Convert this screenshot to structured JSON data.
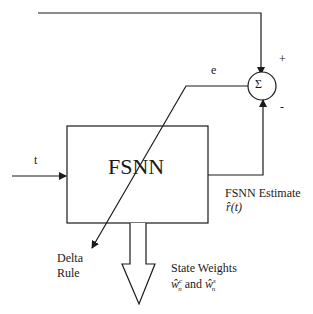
{
  "diagram": {
    "type": "block-diagram",
    "blocks": [
      {
        "id": "fsnn",
        "label": "FSNN"
      },
      {
        "id": "sum",
        "label": "Σ"
      }
    ],
    "summer_signs": {
      "plus": "+",
      "minus": "-"
    },
    "labels": {
      "input": "t",
      "error": "e",
      "estimate_title": "FSNN Estimate",
      "estimate_symbol": "r̂(t)",
      "delta_rule_line1": "Delta",
      "delta_rule_line2": "Rule",
      "weights_title": "State Weights",
      "weights_c": "ŵ",
      "weights_c_sup": "c",
      "weights_c_sub": "n",
      "weights_and": " and ",
      "weights_s": "ŵ",
      "weights_s_sup": "s",
      "weights_s_sub": "n"
    },
    "connections": [
      {
        "from": "reference",
        "to": "sum",
        "sign": "+"
      },
      {
        "from": "fsnn",
        "to": "sum",
        "sign": "-"
      },
      {
        "from": "input_t",
        "to": "fsnn"
      },
      {
        "from": "sum",
        "to": "fsnn",
        "label": "e",
        "via": "Delta Rule"
      },
      {
        "from": "fsnn",
        "to": "state_weights_output"
      }
    ]
  }
}
